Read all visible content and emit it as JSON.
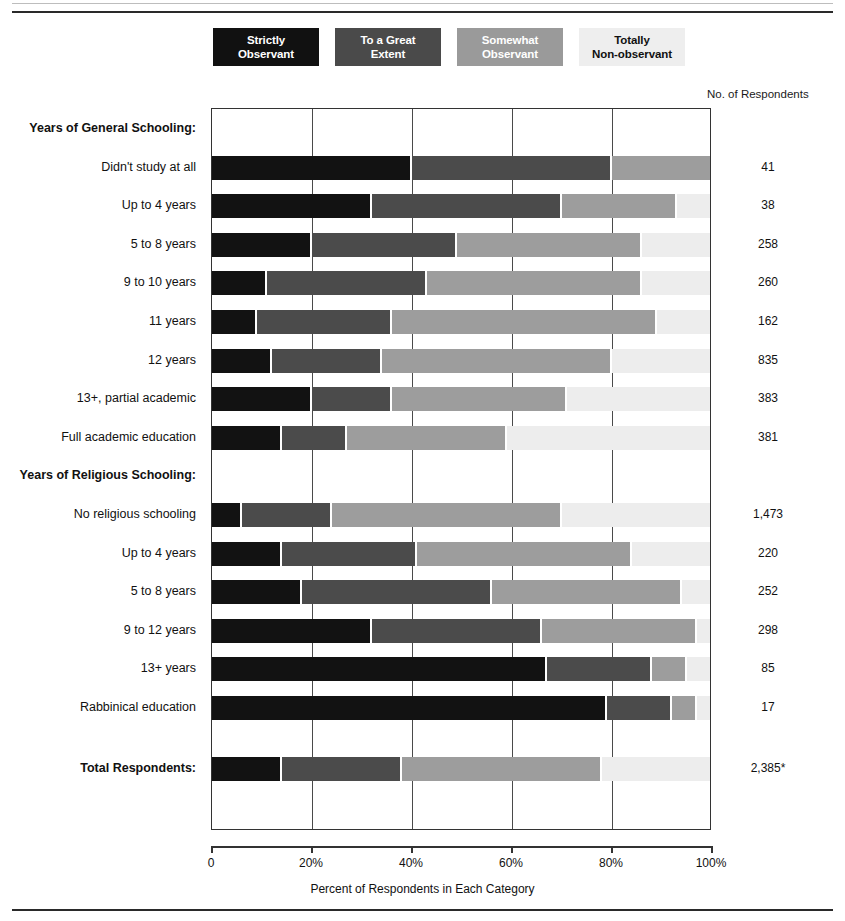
{
  "legend": {
    "items": [
      {
        "label_line1": "Strictly",
        "label_line2": "Observant",
        "color": "#121212"
      },
      {
        "label_line1": "To a Great",
        "label_line2": "Extent",
        "color": "#4b4b4b"
      },
      {
        "label_line1": "Somewhat",
        "label_line2": "Observant",
        "color": "#9d9d9d"
      },
      {
        "label_line1": "Totally",
        "label_line2": "Non-observant",
        "color": "#ededed"
      }
    ]
  },
  "respondents_header": "No. of Respondents",
  "axis": {
    "title": "Percent of Respondents in Each Category",
    "ticks": [
      "0",
      "20%",
      "40%",
      "60%",
      "80%",
      "100%"
    ],
    "tick_values": [
      0,
      20,
      40,
      60,
      80,
      100
    ],
    "min": 0,
    "max": 100
  },
  "chart_data": {
    "type": "bar",
    "orientation": "horizontal",
    "stacked": true,
    "title": "",
    "xlabel": "Percent of Respondents in Each Category",
    "ylabel": "",
    "xlim": [
      0,
      100
    ],
    "grid": true,
    "legend_position": "top",
    "series": [
      {
        "name": "Strictly Observant",
        "color": "#121212"
      },
      {
        "name": "To a Great Extent",
        "color": "#4b4b4b"
      },
      {
        "name": "Somewhat Observant",
        "color": "#9d9d9d"
      },
      {
        "name": "Totally Non-observant",
        "color": "#ededed"
      }
    ],
    "groups": [
      {
        "heading": "Years of General Schooling:",
        "rows": [
          {
            "label": "Didn't study at all",
            "values": [
              40,
              40,
              20,
              0
            ],
            "count": "41"
          },
          {
            "label": "Up to 4 years",
            "values": [
              32,
              38,
              23,
              7
            ],
            "count": "38"
          },
          {
            "label": "5 to 8 years",
            "values": [
              20,
              29,
              37,
              14
            ],
            "count": "258"
          },
          {
            "label": "9 to 10 years",
            "values": [
              11,
              32,
              43,
              14
            ],
            "count": "260"
          },
          {
            "label": "11 years",
            "values": [
              9,
              27,
              53,
              11
            ],
            "count": "162"
          },
          {
            "label": "12 years",
            "values": [
              12,
              22,
              46,
              20
            ],
            "count": "835"
          },
          {
            "label": "13+, partial academic",
            "values": [
              20,
              16,
              35,
              29
            ],
            "count": "383"
          },
          {
            "label": "Full academic education",
            "values": [
              14,
              13,
              32,
              41
            ],
            "count": "381"
          }
        ]
      },
      {
        "heading": "Years of Religious Schooling:",
        "rows": [
          {
            "label": "No religious schooling",
            "values": [
              6,
              18,
              46,
              30
            ],
            "count": "1,473"
          },
          {
            "label": "Up to 4 years",
            "values": [
              14,
              27,
              43,
              16
            ],
            "count": "220"
          },
          {
            "label": "5 to 8 years",
            "values": [
              18,
              38,
              38,
              6
            ],
            "count": "252"
          },
          {
            "label": "9 to 12 years",
            "values": [
              32,
              34,
              31,
              3
            ],
            "count": "298"
          },
          {
            "label": "13+ years",
            "values": [
              67,
              21,
              7,
              5
            ],
            "count": "85"
          },
          {
            "label": "Rabbinical education",
            "values": [
              79,
              13,
              5,
              3
            ],
            "count": "17"
          }
        ]
      }
    ],
    "total_row": {
      "label": "Total Respondents:",
      "values": [
        14,
        24,
        40,
        22
      ],
      "count": "2,385*"
    }
  }
}
